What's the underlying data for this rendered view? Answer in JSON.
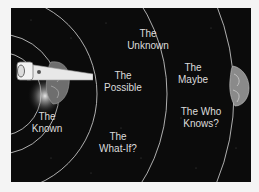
{
  "diagram": {
    "title": "",
    "background_color": "#0b0b0b",
    "arc_color": "#d8d8d8",
    "text_color": "#dcdcdc",
    "zones": [
      {
        "id": "known",
        "line1": "The",
        "line2": "Known"
      },
      {
        "id": "possible",
        "line1": "The",
        "line2": "Possible"
      },
      {
        "id": "what-if",
        "line1": "The",
        "line2": "What-If?"
      },
      {
        "id": "unknown",
        "line1": "The",
        "line2": "Unknown"
      },
      {
        "id": "maybe",
        "line1": "The",
        "line2": "Maybe"
      },
      {
        "id": "who-knows",
        "line1": "The Who",
        "line2": "Knows?"
      }
    ],
    "icons": {
      "telescope": "telescope-icon",
      "galaxy": "galaxy-icon",
      "brain_left": "brain-icon",
      "brain_right": "brain-icon"
    }
  }
}
